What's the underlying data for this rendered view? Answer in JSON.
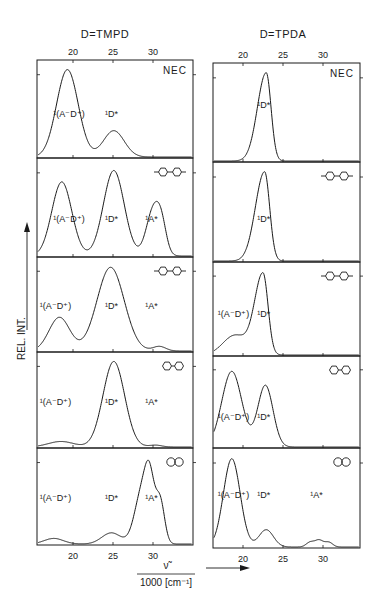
{
  "figure": {
    "y_axis_label": "REL. INT.",
    "x_axis_label_top": "ν̃",
    "x_axis_label_bottom": "1000 [cm⁻¹]",
    "columns": [
      {
        "title": "D=TMPD"
      },
      {
        "title": "D=TPDA"
      }
    ]
  },
  "chart_data": [
    {
      "type": "line",
      "title": "D=TMPD",
      "xlabel": "ν̃ / 1000 [cm⁻¹]",
      "ylabel": "REL. INT.",
      "x_ticks": [
        20,
        25,
        30
      ],
      "xlim": [
        15.5,
        35
      ],
      "grid": false,
      "panels": [
        {
          "acceptor": "NEC",
          "acceptor_icon": "text",
          "labels": [
            {
              "text": "¹(A⁻D⁺)",
              "x": 19.5,
              "y": 0.42
            },
            {
              "text": "¹D*",
              "x": 24.8,
              "y": 0.42
            }
          ],
          "peaks": [
            {
              "center": 19.3,
              "width": 1.35,
              "height": 0.93
            },
            {
              "center": 25.1,
              "width": 1.3,
              "height": 0.28
            }
          ]
        },
        {
          "acceptor": "biphenyl",
          "acceptor_icon": "biphenyl",
          "labels": [
            {
              "text": "¹(A⁻D⁺)",
              "x": 19.5,
              "y": 0.35
            },
            {
              "text": "¹D*",
              "x": 24.8,
              "y": 0.35
            },
            {
              "text": "¹A*",
              "x": 29.8,
              "y": 0.35
            }
          ],
          "peaks": [
            {
              "center": 18.6,
              "width": 1.25,
              "height": 0.78
            },
            {
              "center": 25.1,
              "width": 1.3,
              "height": 0.9
            },
            {
              "center": 30.1,
              "width": 0.9,
              "height": 0.5
            },
            {
              "center": 31.1,
              "width": 0.6,
              "height": 0.2
            }
          ]
        },
        {
          "acceptor": "biphenyl",
          "acceptor_icon": "biphenyl",
          "labels": [
            {
              "text": "¹(A⁻D⁺)",
              "x": 17.8,
              "y": 0.45
            },
            {
              "text": "¹D*",
              "x": 24.8,
              "y": 0.45
            },
            {
              "text": "¹A*",
              "x": 29.8,
              "y": 0.45
            }
          ],
          "peaks": [
            {
              "center": 18.3,
              "width": 1.3,
              "height": 0.37
            },
            {
              "center": 24.7,
              "width": 1.7,
              "height": 0.92
            },
            {
              "center": 30.8,
              "width": 0.8,
              "height": 0.05
            }
          ]
        },
        {
          "acceptor": "biphenyl",
          "acceptor_icon": "biphenyl-small",
          "labels": [
            {
              "text": "¹(A⁻D⁺)",
              "x": 17.8,
              "y": 0.45
            },
            {
              "text": "¹D*",
              "x": 24.8,
              "y": 0.45
            },
            {
              "text": "¹A*",
              "x": 29.8,
              "y": 0.45
            }
          ],
          "peaks": [
            {
              "center": 18.5,
              "width": 1.6,
              "height": 0.06
            },
            {
              "center": 25.1,
              "width": 1.35,
              "height": 0.93
            },
            {
              "center": 30.3,
              "width": 0.8,
              "height": 0.02
            }
          ]
        },
        {
          "acceptor": "naphthalene",
          "acceptor_icon": "naphthalene",
          "labels": [
            {
              "text": "¹(A⁻D⁺)",
              "x": 17.8,
              "y": 0.45
            },
            {
              "text": "¹D*",
              "x": 24.8,
              "y": 0.45
            },
            {
              "text": "¹A*",
              "x": 29.8,
              "y": 0.45
            }
          ],
          "peaks": [
            {
              "center": 17.6,
              "width": 1.2,
              "height": 0.06
            },
            {
              "center": 24.8,
              "width": 1.2,
              "height": 0.12
            },
            {
              "center": 28.6,
              "width": 0.9,
              "height": 0.55
            },
            {
              "center": 29.6,
              "width": 0.6,
              "height": 0.55
            },
            {
              "center": 30.9,
              "width": 0.55,
              "height": 0.45
            }
          ]
        }
      ]
    },
    {
      "type": "line",
      "title": "D=TPDA",
      "xlabel": "ν̃ / 1000 [cm⁻¹]",
      "ylabel": "REL. INT.",
      "x_ticks": [
        20,
        25,
        30
      ],
      "xlim": [
        16.25,
        34.6
      ],
      "grid": false,
      "panels": [
        {
          "acceptor": "NEC",
          "acceptor_icon": "text",
          "labels": [
            {
              "text": "¹D*",
              "x": 22.6,
              "y": 0.55
            }
          ],
          "peaks": [
            {
              "center": 22.9,
              "width": 1.1,
              "height": 0.93,
              "skew": 0.55
            }
          ]
        },
        {
          "acceptor": "biphenyl",
          "acceptor_icon": "biphenyl",
          "labels": [
            {
              "text": "¹D*",
              "x": 22.6,
              "y": 0.4
            }
          ],
          "peaks": [
            {
              "center": 22.7,
              "width": 1.15,
              "height": 0.93,
              "skew": 0.55
            }
          ]
        },
        {
          "acceptor": "biphenyl",
          "acceptor_icon": "biphenyl",
          "labels": [
            {
              "text": "¹(A⁻D⁺)",
              "x": 18.8,
              "y": 0.42
            },
            {
              "text": "¹D*",
              "x": 22.6,
              "y": 0.42
            }
          ],
          "peaks": [
            {
              "center": 19.0,
              "width": 1.5,
              "height": 0.22
            },
            {
              "center": 22.5,
              "width": 1.05,
              "height": 0.9,
              "skew": 0.6
            }
          ]
        },
        {
          "acceptor": "biphenyl",
          "acceptor_icon": "biphenyl-small",
          "labels": [
            {
              "text": "¹(A⁻D⁺)",
              "x": 18.8,
              "y": 0.3
            },
            {
              "text": "¹D*",
              "x": 22.6,
              "y": 0.3
            }
          ],
          "peaks": [
            {
              "center": 18.6,
              "width": 1.25,
              "height": 0.86
            },
            {
              "center": 22.8,
              "width": 0.95,
              "height": 0.7
            }
          ]
        },
        {
          "acceptor": "naphthalene",
          "acceptor_icon": "naphthalene",
          "labels": [
            {
              "text": "¹(A⁻D⁺)",
              "x": 18.8,
              "y": 0.5
            },
            {
              "text": "¹D*",
              "x": 22.6,
              "y": 0.5
            },
            {
              "text": "¹A*",
              "x": 29.2,
              "y": 0.5
            }
          ],
          "peaks": [
            {
              "center": 18.6,
              "width": 1.05,
              "height": 0.92
            },
            {
              "center": 22.9,
              "width": 0.9,
              "height": 0.18
            },
            {
              "center": 28.4,
              "width": 0.5,
              "height": 0.05
            },
            {
              "center": 29.5,
              "width": 0.5,
              "height": 0.07
            },
            {
              "center": 30.7,
              "width": 0.5,
              "height": 0.05
            }
          ]
        }
      ]
    }
  ]
}
